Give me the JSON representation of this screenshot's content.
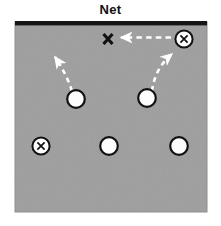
{
  "diagram": {
    "title": "Net",
    "type": "volleyball-court-formation-diagram",
    "colors": {
      "court_fill": "#9e9e9e",
      "net_line": "#1a1a1a",
      "player_fill": "#fdfdfd",
      "player_stroke": "#111111",
      "arrow": "#ffffff",
      "mark_text": "#111111",
      "background": "#ffffff"
    },
    "court": {
      "x": 15,
      "y": 22,
      "width": 192,
      "height": 190,
      "net_thickness": 4
    },
    "markers": [
      {
        "id": "target-x",
        "kind": "x-mark",
        "label": "X",
        "cx": 108,
        "cy": 39,
        "radius": 0
      },
      {
        "id": "server-circled-x",
        "kind": "circled-x",
        "label": "X",
        "cx": 184,
        "cy": 39,
        "radius": 9
      },
      {
        "id": "front-left-player",
        "kind": "open-circle",
        "label": "",
        "cx": 76,
        "cy": 99,
        "radius": 9
      },
      {
        "id": "front-right-player",
        "kind": "open-circle",
        "label": "",
        "cx": 147,
        "cy": 98,
        "radius": 9
      },
      {
        "id": "back-left-circled-x",
        "kind": "circled-x",
        "label": "X",
        "cx": 41,
        "cy": 146,
        "radius": 9
      },
      {
        "id": "back-middle-player",
        "kind": "open-circle",
        "label": "",
        "cx": 109,
        "cy": 146,
        "radius": 9
      },
      {
        "id": "back-right-player",
        "kind": "open-circle",
        "label": "",
        "cx": 179,
        "cy": 146,
        "radius": 9
      }
    ],
    "arrows": [
      {
        "id": "front-left-movement-arrow",
        "style": "dashed",
        "from": [
          72,
          90
        ],
        "to": [
          54,
          55
        ],
        "curve": [
          66,
          70
        ]
      },
      {
        "id": "front-right-to-server-arrow",
        "style": "dashed",
        "from": [
          153,
          90
        ],
        "to": [
          173,
          52
        ],
        "curve": [
          156,
          66
        ]
      },
      {
        "id": "server-to-target-arrow",
        "style": "dashed",
        "from": [
          171,
          37
        ],
        "to": [
          120,
          37
        ],
        "curve": [
          146,
          37
        ]
      }
    ]
  }
}
